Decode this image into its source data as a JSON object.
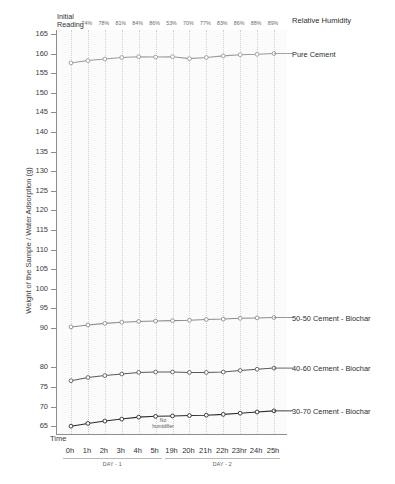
{
  "chart_data": {
    "type": "line",
    "title": "",
    "xlabel": "Time",
    "ylabel": "Weight of the Sample / Water Adsorption (g)",
    "ylim": [
      63,
      166
    ],
    "yticks": [
      165,
      160,
      155,
      150,
      145,
      140,
      135,
      130,
      125,
      120,
      115,
      110,
      105,
      100,
      95,
      90,
      80,
      75,
      70,
      65
    ],
    "grid": "vertical-dotted",
    "legend_position": "right-inline",
    "x": [
      "0h",
      "1h",
      "2h",
      "3h",
      "4h",
      "5h",
      "19h",
      "20h",
      "21h",
      "22h",
      "23hr",
      "24h",
      "25h"
    ],
    "relative_humidity": [
      "74%",
      "78%",
      "81%",
      "84%",
      "86%",
      "53%",
      "70%",
      "77%",
      "83%",
      "86%",
      "88%",
      "89%"
    ],
    "humidity_caption": "Relative Humidity",
    "initial_reading_label": "Initial\nReading",
    "day_groups": [
      {
        "label": "DAY - 1",
        "ticks": [
          "0h",
          "1h",
          "2h",
          "3h",
          "4h",
          "5h"
        ]
      },
      {
        "label": "DAY - 2",
        "ticks": [
          "19h",
          "20h",
          "21h",
          "22h",
          "23hr",
          "24h",
          "25h"
        ]
      }
    ],
    "annotations": [
      {
        "name": "no-humidifier-note",
        "text": "No\nhumidifier",
        "x": "between 5h and 19h"
      }
    ],
    "series": [
      {
        "name": "Pure Cement",
        "color": "#9a9a9a",
        "values": [
          157.6,
          158.2,
          158.6,
          159.0,
          159.2,
          159.1,
          159.2,
          158.7,
          159.0,
          159.4,
          159.7,
          159.8,
          160.0
        ]
      },
      {
        "name": "50-50  Cement - Biochar",
        "color": "#8c8c8c",
        "values": [
          90.3,
          90.8,
          91.2,
          91.5,
          91.7,
          91.8,
          91.9,
          92.0,
          92.2,
          92.3,
          92.5,
          92.6,
          92.7
        ]
      },
      {
        "name": "40-60  Cement - Biochar",
        "color": "#5a5a5a",
        "values": [
          76.6,
          77.4,
          77.9,
          78.3,
          78.7,
          78.8,
          78.8,
          78.7,
          78.7,
          78.8,
          79.2,
          79.5,
          79.8
        ]
      },
      {
        "name": "30-70  Cement - Biochar",
        "color": "#2b2b2b",
        "values": [
          65.0,
          65.7,
          66.3,
          66.8,
          67.3,
          67.5,
          67.6,
          67.7,
          67.8,
          68.0,
          68.3,
          68.6,
          68.9
        ]
      }
    ]
  }
}
